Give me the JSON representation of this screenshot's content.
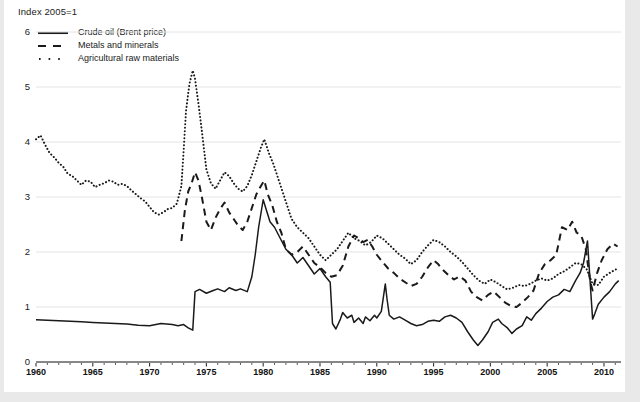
{
  "figure": {
    "background": "#ffffff",
    "page_background": "#e9e9e9",
    "line_color": "#1a1a1a",
    "grid_color": "#e4e4e4"
  },
  "chart_data": {
    "type": "line",
    "title": "",
    "subtitle": "",
    "ylabel": "Index 2005=1",
    "xlabel": "",
    "grid": true,
    "legend_position": "top-left",
    "xlim": [
      1960,
      2011.5
    ],
    "ylim": [
      0,
      6
    ],
    "yticks": [
      0,
      1,
      2,
      3,
      4,
      5,
      6
    ],
    "ytick_labels": [
      "0",
      "1",
      "2",
      "3",
      "4",
      "5",
      "6"
    ],
    "xticks": [
      1960,
      1965,
      1970,
      1975,
      1980,
      1985,
      1990,
      1995,
      2000,
      2005,
      2010
    ],
    "xtick_labels": [
      "1960",
      "1965",
      "1970",
      "1975",
      "1980",
      "1985",
      "1990",
      "1995",
      "2000",
      "2005",
      "2010"
    ],
    "minor_xtick_interval": 1,
    "series": [
      {
        "name": "Crude oil (Brent price)",
        "key": "crude-oil",
        "style": "solid",
        "color": "#1a1a1a",
        "x": [
          1960.0,
          1961.0,
          1962.0,
          1963.0,
          1964.0,
          1965.0,
          1966.0,
          1967.0,
          1968.0,
          1969.0,
          1970.0,
          1971.0,
          1972.0,
          1972.5,
          1973.0,
          1973.4,
          1973.8,
          1974.0,
          1974.4,
          1975.0,
          1975.6,
          1976.0,
          1976.6,
          1977.0,
          1977.6,
          1978.0,
          1978.6,
          1979.0,
          1979.3,
          1979.6,
          1980.0,
          1980.3,
          1980.6,
          1981.0,
          1981.5,
          1982.0,
          1982.5,
          1983.0,
          1983.5,
          1984.0,
          1984.5,
          1985.0,
          1985.5,
          1985.9,
          1986.1,
          1986.4,
          1986.8,
          1987.0,
          1987.4,
          1987.8,
          1988.0,
          1988.4,
          1988.8,
          1989.0,
          1989.4,
          1989.8,
          1990.0,
          1990.4,
          1990.75,
          1990.9,
          1991.1,
          1991.5,
          1992.0,
          1992.5,
          1993.0,
          1993.5,
          1994.0,
          1994.5,
          1995.0,
          1995.5,
          1996.0,
          1996.5,
          1997.0,
          1997.5,
          1998.0,
          1998.5,
          1998.9,
          1999.3,
          1999.8,
          2000.2,
          2000.7,
          2001.0,
          2001.5,
          2001.9,
          2002.3,
          2002.8,
          2003.2,
          2003.6,
          2004.0,
          2004.5,
          2005.0,
          2005.5,
          2006.0,
          2006.5,
          2007.0,
          2007.5,
          2007.9,
          2008.2,
          2008.55,
          2008.8,
          2009.0,
          2009.2,
          2009.5,
          2010.0,
          2010.5,
          2011.0,
          2011.3
        ],
        "y": [
          0.77,
          0.76,
          0.75,
          0.74,
          0.73,
          0.72,
          0.71,
          0.7,
          0.69,
          0.67,
          0.66,
          0.7,
          0.68,
          0.66,
          0.68,
          0.62,
          0.58,
          1.28,
          1.32,
          1.25,
          1.3,
          1.33,
          1.28,
          1.35,
          1.3,
          1.33,
          1.28,
          1.55,
          1.95,
          2.45,
          2.95,
          2.75,
          2.55,
          2.45,
          2.25,
          2.05,
          1.95,
          1.8,
          1.9,
          1.75,
          1.6,
          1.7,
          1.55,
          1.45,
          0.7,
          0.6,
          0.78,
          0.9,
          0.8,
          0.85,
          0.72,
          0.8,
          0.7,
          0.82,
          0.75,
          0.85,
          0.8,
          0.92,
          1.42,
          1.15,
          0.85,
          0.78,
          0.82,
          0.76,
          0.7,
          0.66,
          0.68,
          0.74,
          0.76,
          0.74,
          0.82,
          0.85,
          0.8,
          0.72,
          0.55,
          0.4,
          0.3,
          0.4,
          0.55,
          0.72,
          0.78,
          0.7,
          0.62,
          0.52,
          0.6,
          0.66,
          0.82,
          0.76,
          0.88,
          0.98,
          1.1,
          1.18,
          1.22,
          1.32,
          1.28,
          1.48,
          1.62,
          1.8,
          2.2,
          1.4,
          0.78,
          0.88,
          1.05,
          1.18,
          1.28,
          1.42,
          1.48
        ]
      },
      {
        "name": "Metals and minerals",
        "key": "metals-minerals",
        "style": "dashed",
        "color": "#1a1a1a",
        "x": [
          1972.8,
          1973.1,
          1973.4,
          1973.7,
          1974.0,
          1974.3,
          1974.6,
          1975.0,
          1975.4,
          1975.8,
          1976.2,
          1976.6,
          1977.0,
          1977.4,
          1977.8,
          1978.2,
          1978.6,
          1979.0,
          1979.4,
          1979.8,
          1980.1,
          1980.4,
          1980.8,
          1981.2,
          1981.6,
          1982.0,
          1982.5,
          1983.0,
          1983.5,
          1984.0,
          1984.5,
          1985.0,
          1985.5,
          1986.0,
          1986.5,
          1987.0,
          1987.5,
          1988.0,
          1988.4,
          1988.8,
          1989.2,
          1989.6,
          1990.0,
          1990.5,
          1991.0,
          1991.5,
          1992.0,
          1992.5,
          1993.0,
          1993.5,
          1994.0,
          1994.5,
          1995.0,
          1995.4,
          1995.8,
          1996.3,
          1996.8,
          1997.3,
          1997.8,
          1998.3,
          1998.8,
          1999.3,
          1999.8,
          2000.3,
          2000.8,
          2001.3,
          2001.8,
          2002.3,
          2002.8,
          2003.3,
          2003.8,
          2004.3,
          2004.8,
          2005.3,
          2005.8,
          2006.3,
          2006.8,
          2007.2,
          2007.6,
          2008.0,
          2008.4,
          2008.8,
          2009.0,
          2009.4,
          2009.8,
          2010.3,
          2010.8,
          2011.2
        ],
        "y": [
          2.2,
          2.75,
          3.1,
          3.25,
          3.45,
          3.3,
          3.0,
          2.55,
          2.4,
          2.62,
          2.78,
          2.9,
          2.72,
          2.6,
          2.48,
          2.4,
          2.55,
          2.8,
          3.05,
          3.2,
          3.3,
          3.05,
          2.85,
          2.55,
          2.35,
          2.05,
          1.95,
          2.0,
          2.1,
          1.95,
          1.8,
          1.72,
          1.62,
          1.55,
          1.58,
          1.75,
          2.1,
          2.3,
          2.25,
          2.18,
          2.22,
          2.1,
          1.95,
          1.82,
          1.7,
          1.62,
          1.52,
          1.45,
          1.38,
          1.42,
          1.55,
          1.72,
          1.85,
          1.78,
          1.68,
          1.58,
          1.5,
          1.56,
          1.48,
          1.28,
          1.18,
          1.12,
          1.22,
          1.28,
          1.18,
          1.08,
          1.02,
          1.0,
          1.08,
          1.18,
          1.3,
          1.62,
          1.78,
          1.85,
          1.95,
          2.45,
          2.4,
          2.55,
          2.35,
          2.3,
          2.05,
          1.45,
          1.3,
          1.62,
          1.85,
          2.05,
          2.15,
          2.1
        ]
      },
      {
        "name": "Agricultural raw materials",
        "key": "agricultural-raw-materials",
        "style": "dotted",
        "color": "#1a1a1a",
        "x": [
          1960.0,
          1960.4,
          1960.8,
          1961.2,
          1961.6,
          1962.0,
          1962.4,
          1962.8,
          1963.2,
          1963.6,
          1964.0,
          1964.4,
          1964.8,
          1965.2,
          1965.6,
          1966.0,
          1966.4,
          1966.8,
          1967.2,
          1967.6,
          1968.0,
          1968.4,
          1968.8,
          1969.2,
          1969.6,
          1970.0,
          1970.4,
          1970.8,
          1971.2,
          1971.6,
          1972.0,
          1972.4,
          1972.8,
          1973.0,
          1973.2,
          1973.5,
          1973.8,
          1974.0,
          1974.3,
          1974.6,
          1975.0,
          1975.4,
          1975.8,
          1976.2,
          1976.6,
          1977.0,
          1977.4,
          1977.8,
          1978.2,
          1978.6,
          1979.0,
          1979.4,
          1979.8,
          1980.1,
          1980.5,
          1980.9,
          1981.3,
          1981.7,
          1982.1,
          1982.5,
          1983.0,
          1983.5,
          1984.0,
          1984.5,
          1985.0,
          1985.5,
          1986.0,
          1986.5,
          1987.0,
          1987.5,
          1988.0,
          1988.5,
          1989.0,
          1989.5,
          1990.0,
          1990.5,
          1991.0,
          1991.5,
          1992.0,
          1992.5,
          1993.0,
          1993.5,
          1994.0,
          1994.5,
          1995.0,
          1995.5,
          1996.0,
          1996.5,
          1997.0,
          1997.5,
          1998.0,
          1998.5,
          1999.0,
          1999.5,
          2000.0,
          2000.5,
          2001.0,
          2001.5,
          2002.0,
          2002.5,
          2003.0,
          2003.5,
          2004.0,
          2004.5,
          2005.0,
          2005.5,
          2006.0,
          2006.5,
          2007.0,
          2007.5,
          2008.0,
          2008.5,
          2009.0,
          2009.5,
          2010.0,
          2010.5,
          2011.0,
          2011.3
        ],
        "y": [
          4.05,
          4.12,
          3.95,
          3.8,
          3.72,
          3.62,
          3.55,
          3.42,
          3.38,
          3.3,
          3.22,
          3.3,
          3.28,
          3.18,
          3.22,
          3.25,
          3.3,
          3.28,
          3.22,
          3.24,
          3.2,
          3.12,
          3.05,
          2.98,
          2.92,
          2.82,
          2.72,
          2.68,
          2.72,
          2.78,
          2.8,
          2.88,
          3.2,
          3.85,
          4.55,
          5.05,
          5.3,
          5.15,
          4.7,
          4.2,
          3.5,
          3.25,
          3.15,
          3.3,
          3.45,
          3.38,
          3.25,
          3.15,
          3.1,
          3.2,
          3.4,
          3.65,
          3.9,
          4.05,
          3.8,
          3.6,
          3.35,
          3.1,
          2.85,
          2.6,
          2.45,
          2.35,
          2.25,
          2.1,
          1.95,
          1.85,
          1.95,
          2.05,
          2.2,
          2.35,
          2.25,
          2.2,
          2.12,
          2.18,
          2.3,
          2.25,
          2.15,
          2.05,
          1.95,
          1.88,
          1.78,
          1.85,
          2.0,
          2.12,
          2.22,
          2.18,
          2.1,
          2.0,
          1.92,
          1.82,
          1.7,
          1.58,
          1.48,
          1.42,
          1.5,
          1.45,
          1.38,
          1.32,
          1.35,
          1.4,
          1.38,
          1.42,
          1.48,
          1.52,
          1.48,
          1.52,
          1.6,
          1.65,
          1.72,
          1.8,
          1.78,
          1.68,
          1.42,
          1.4,
          1.55,
          1.62,
          1.68,
          1.7
        ]
      }
    ]
  },
  "caption": ""
}
